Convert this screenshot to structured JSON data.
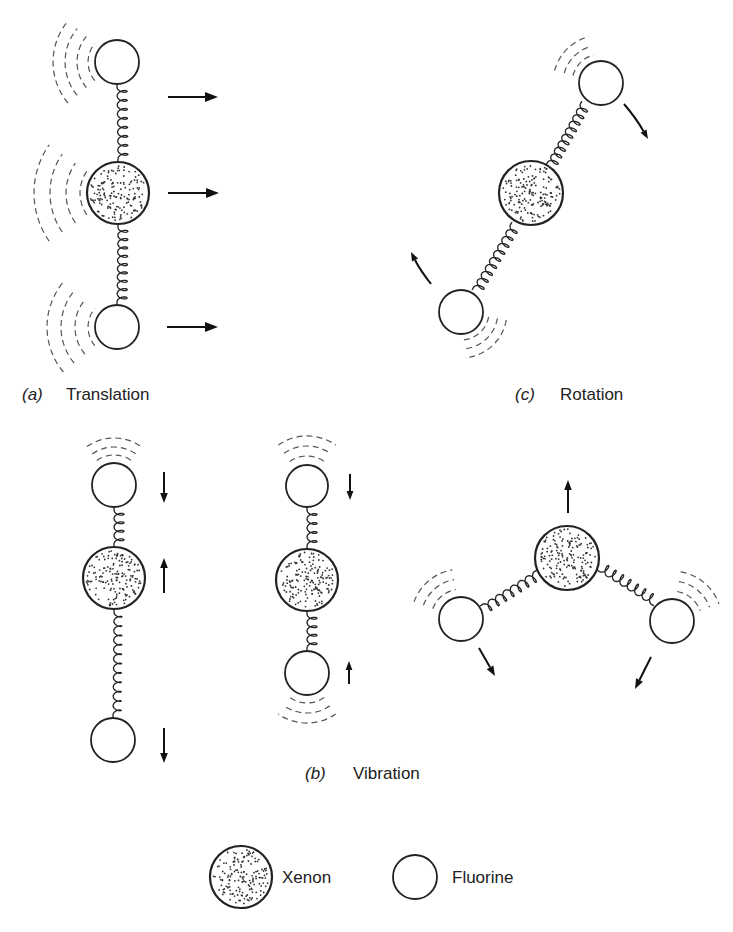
{
  "figure": {
    "panels": {
      "translation": {
        "letter": "(a)",
        "title": "Translation"
      },
      "vibration": {
        "letter": "(b)",
        "title": "Vibration"
      },
      "rotation": {
        "letter": "(c)",
        "title": "Rotation"
      }
    },
    "legend": {
      "xenon": {
        "label": "Xenon",
        "icon": "stippled-circle"
      },
      "fluorine": {
        "label": "Fluorine",
        "icon": "open-circle"
      }
    },
    "colors": {
      "ink": "#222222",
      "background": "#ffffff"
    }
  }
}
